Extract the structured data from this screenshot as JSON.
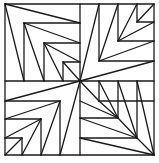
{
  "figure": {
    "stroke_color": "#1a1a1a",
    "background": "#ffffff",
    "caption": "",
    "square": {
      "x1": 5,
      "y1": 4,
      "x2": 154,
      "y2": 155
    },
    "center": [
      80,
      81
    ],
    "lines": [
      [
        5,
        4,
        154,
        4
      ],
      [
        154,
        4,
        154,
        155
      ],
      [
        154,
        155,
        5,
        155
      ],
      [
        5,
        155,
        5,
        4
      ],
      [
        80,
        4,
        80,
        155
      ],
      [
        5,
        81,
        154,
        81
      ],
      [
        24,
        23,
        80,
        23
      ],
      [
        24,
        23,
        24,
        81
      ],
      [
        44,
        43,
        80,
        43
      ],
      [
        44,
        43,
        44,
        81
      ],
      [
        63,
        62,
        80,
        62
      ],
      [
        63,
        62,
        63,
        81
      ],
      [
        5,
        4,
        80,
        23
      ],
      [
        5,
        4,
        24,
        81
      ],
      [
        24,
        23,
        80,
        43
      ],
      [
        24,
        23,
        44,
        81
      ],
      [
        44,
        43,
        80,
        62
      ],
      [
        44,
        43,
        63,
        81
      ],
      [
        63,
        62,
        80,
        81
      ],
      [
        99,
        4,
        99,
        61
      ],
      [
        99,
        61,
        154,
        61
      ],
      [
        118,
        4,
        118,
        41
      ],
      [
        118,
        41,
        154,
        41
      ],
      [
        137,
        4,
        137,
        22
      ],
      [
        137,
        22,
        154,
        22
      ],
      [
        80,
        81,
        99,
        4
      ],
      [
        80,
        81,
        154,
        61
      ],
      [
        99,
        61,
        118,
        4
      ],
      [
        99,
        61,
        154,
        41
      ],
      [
        118,
        41,
        137,
        4
      ],
      [
        118,
        41,
        154,
        22
      ],
      [
        137,
        22,
        154,
        4
      ],
      [
        5,
        101,
        60,
        101
      ],
      [
        60,
        101,
        60,
        155
      ],
      [
        5,
        119,
        41,
        119
      ],
      [
        41,
        119,
        41,
        155
      ],
      [
        5,
        138,
        22,
        138
      ],
      [
        22,
        138,
        22,
        155
      ],
      [
        80,
        81,
        5,
        101
      ],
      [
        80,
        81,
        60,
        155
      ],
      [
        60,
        101,
        5,
        119
      ],
      [
        60,
        101,
        41,
        155
      ],
      [
        41,
        119,
        5,
        138
      ],
      [
        41,
        119,
        22,
        155
      ],
      [
        22,
        138,
        5,
        155
      ],
      [
        99,
        81,
        99,
        101
      ],
      [
        99,
        101,
        154,
        101
      ],
      [
        118,
        81,
        118,
        118
      ],
      [
        118,
        118,
        80,
        118
      ],
      [
        137,
        81,
        137,
        138
      ],
      [
        137,
        138,
        80,
        138
      ],
      [
        80,
        81,
        99,
        101
      ],
      [
        99,
        101,
        118,
        118
      ],
      [
        99,
        81,
        118,
        118
      ],
      [
        118,
        118,
        137,
        138
      ],
      [
        118,
        81,
        137,
        138
      ],
      [
        137,
        138,
        154,
        155
      ],
      [
        137,
        81,
        154,
        155
      ],
      [
        80,
        101,
        118,
        118
      ],
      [
        80,
        118,
        137,
        138
      ],
      [
        80,
        138,
        154,
        155
      ]
    ]
  }
}
